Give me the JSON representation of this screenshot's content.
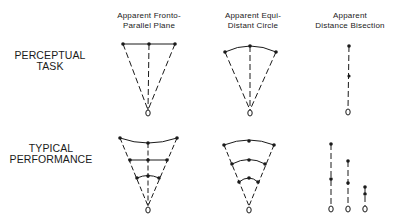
{
  "row_labels": {
    "perceptual_task": {
      "line1": "PERCEPTUAL",
      "line2": "TASK"
    },
    "typical_performance": {
      "line1": "TYPICAL",
      "line2": "PERFORMANCE"
    }
  },
  "column_headers": {
    "fronto_parallel": {
      "line1": "Apparent Fronto-",
      "line2": "Parallel Plane"
    },
    "equi_distant": {
      "line1": "Apparent Equi-",
      "line2": "Distant Circle"
    },
    "bisection": {
      "line1": "Apparent",
      "line2": "Distance Bisection"
    }
  },
  "diagram": {
    "ink_color": "#1a1a1a",
    "background": "#ffffff",
    "panels": [
      {
        "id": "task-fronto-parallel",
        "row": "Perceptual Task",
        "column": "Apparent Fronto-Parallel Plane",
        "eye": [
          148,
          113
        ],
        "rows_of_points": [
          [
            [
              123,
              44
            ],
            [
              149,
              44
            ],
            [
              175,
              44
            ]
          ]
        ],
        "row_shape": "straight line"
      },
      {
        "id": "task-equi-distant",
        "row": "Perceptual Task",
        "column": "Apparent Equi-Distant Circle",
        "eye": [
          250,
          113
        ],
        "rows_of_points": [
          [
            [
              225,
              52
            ],
            [
              250,
              46
            ],
            [
              276,
              52
            ]
          ]
        ],
        "row_shape": "arc"
      },
      {
        "id": "task-bisection",
        "row": "Perceptual Task",
        "column": "Apparent Distance Bisection",
        "eye": [
          348,
          112
        ],
        "points": [
          [
            349,
            46
          ],
          [
            349,
            76
          ]
        ]
      },
      {
        "id": "performance-fronto-parallel",
        "row": "Typical Performance",
        "column": "Apparent Fronto-Parallel Plane",
        "eye": [
          148,
          210
        ],
        "rows_of_points": [
          [
            [
              120,
              138
            ],
            [
              148,
              143
            ],
            [
              177,
              138
            ]
          ],
          [
            [
              130,
              160
            ],
            [
              148,
              160
            ],
            [
              167,
              160
            ]
          ],
          [
            [
              137,
              178
            ],
            [
              148,
              176
            ],
            [
              159,
              178
            ]
          ]
        ],
        "row_shape": "curves changing from concave (far) to convex (near)"
      },
      {
        "id": "performance-equi-distant",
        "row": "Typical Performance",
        "column": "Apparent Equi-Distant Circle",
        "eye": [
          249,
          210
        ],
        "rows_of_points": [
          [
            [
              224,
              145
            ],
            [
              249,
              141
            ],
            [
              274,
              145
            ]
          ],
          [
            [
              232,
              164
            ],
            [
              249,
              160
            ],
            [
              265,
              164
            ]
          ],
          [
            [
              239,
              182
            ],
            [
              249,
              178
            ],
            [
              258,
              182
            ]
          ]
        ],
        "row_shape": "arcs"
      },
      {
        "id": "performance-bisection",
        "row": "Typical Performance",
        "column": "Apparent Distance Bisection",
        "lines": [
          {
            "eye": [
              331,
              209
            ],
            "points": [
              [
                331,
                144
              ],
              [
                331,
                179
              ]
            ]
          },
          {
            "eye": [
              348,
              209
            ],
            "points": [
              [
                348,
                161
              ],
              [
                348,
                183
              ]
            ]
          },
          {
            "eye": [
              365,
              209
            ],
            "points": [
              [
                365,
                187
              ],
              [
                365,
                194
              ]
            ]
          }
        ]
      }
    ]
  }
}
